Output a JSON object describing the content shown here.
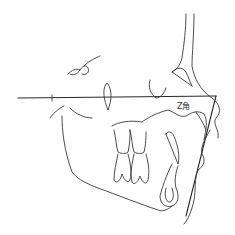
{
  "diagram": {
    "type": "cephalometric-tracing",
    "labels": {
      "z_angle": "Z角"
    },
    "stroke_color": "#3a3a3a",
    "background": "#ffffff"
  }
}
